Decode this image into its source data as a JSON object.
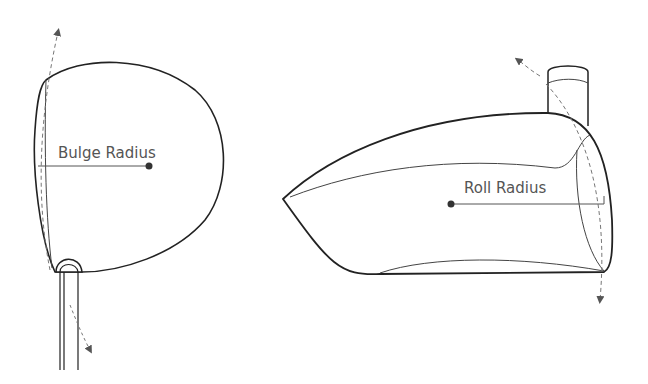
{
  "diagram": {
    "left_view": {
      "label": "Bulge Radius",
      "description": "Top view of driver head showing face curvature from heel to toe"
    },
    "right_view": {
      "label": "Roll Radius",
      "description": "Face-on view of driver head showing face curvature from crown to sole"
    },
    "colors": {
      "outline": "#222222",
      "dashed": "#777777",
      "text": "#555555",
      "background": "#ffffff"
    }
  }
}
